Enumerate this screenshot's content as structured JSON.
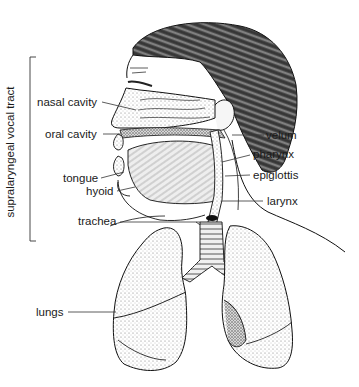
{
  "diagram": {
    "type": "anatomical illustration",
    "bracket_label": "supralaryngeal vocal tract",
    "labels": {
      "nasal_cavity": "nasal cavity",
      "oral_cavity": "oral cavity",
      "tongue": "tongue",
      "hyoid": "hyoid",
      "trachea": "trachea",
      "lungs": "lungs",
      "velum": "velum",
      "pharynx": "pharynx",
      "epiglottis": "epiglottis",
      "larynx": "larynx"
    },
    "colors": {
      "ink": "#1a1a1a",
      "background": "#ffffff",
      "stipple": "#bdbdbd",
      "hair": "#3a3a3a"
    }
  }
}
